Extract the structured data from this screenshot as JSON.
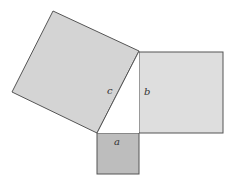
{
  "diagram": {
    "type": "pythagorean-theorem-squares",
    "labels": {
      "a": "a",
      "b": "b",
      "c": "c"
    },
    "colors": {
      "square_c_fill": "#d4d4d4",
      "square_b_fill": "#dedede",
      "square_a_fill": "#bdbdbd",
      "stroke": "#555555",
      "background": "#ffffff"
    }
  }
}
